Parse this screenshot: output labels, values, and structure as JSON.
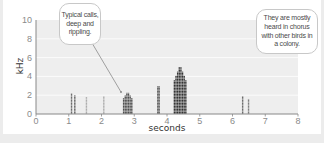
{
  "chart_data": {
    "type": "heatmap",
    "subtype": "spectrogram",
    "title": "",
    "xlabel": "seconds",
    "ylabel": "kHz",
    "xlim": [
      0,
      8
    ],
    "ylim": [
      0,
      10
    ],
    "x_ticks": [
      "0",
      "1",
      "2",
      "3",
      "4",
      "5",
      "6",
      "7",
      "8"
    ],
    "y_ticks": [
      "0",
      "2",
      "4",
      "6",
      "8",
      "10"
    ],
    "grid": "horizontal",
    "syllables": [
      {
        "t_start": 1.05,
        "t_end": 1.12,
        "f_max": 2.2,
        "intensity": 0.7
      },
      {
        "t_start": 1.15,
        "t_end": 1.22,
        "f_max": 2.0,
        "intensity": 0.75
      },
      {
        "t_start": 1.52,
        "t_end": 1.56,
        "f_max": 1.8,
        "intensity": 0.35
      },
      {
        "t_start": 2.05,
        "t_end": 2.09,
        "f_max": 1.9,
        "intensity": 0.35
      },
      {
        "t_start": 2.65,
        "t_end": 2.95,
        "f_max": 2.4,
        "intensity": 0.85
      },
      {
        "t_start": 3.7,
        "t_end": 3.78,
        "f_max": 3.6,
        "intensity": 0.8
      },
      {
        "t_start": 4.2,
        "t_end": 4.6,
        "f_max": 5.2,
        "intensity": 1.0
      },
      {
        "t_start": 6.28,
        "t_end": 6.34,
        "f_max": 1.9,
        "intensity": 0.7
      },
      {
        "t_start": 6.46,
        "t_end": 6.52,
        "f_max": 1.6,
        "intensity": 0.6
      }
    ],
    "annotations": [
      {
        "text": "Typical calls, deep and rippling.",
        "points_to": {
          "t": 2.65,
          "f": 2.4
        }
      },
      {
        "text": "They are mostly heard in chorus with other birds in a colony."
      }
    ]
  },
  "axes": {
    "xlabel": "seconds",
    "ylabel": "kHz",
    "x_ticks": [
      "0",
      "1",
      "2",
      "3",
      "4",
      "5",
      "6",
      "7",
      "8"
    ],
    "y_ticks": [
      "0",
      "2",
      "4",
      "6",
      "8",
      "10"
    ]
  },
  "callouts": {
    "left": {
      "lines": [
        "Typical calls,",
        "deep and",
        "rippling."
      ]
    },
    "right": {
      "lines": [
        "They are mostly",
        "heard in chorus",
        "with other birds in",
        "a colony."
      ]
    }
  },
  "colors": {
    "plot_bg": "#eeeeee",
    "gridline": "#ffffff",
    "axis": "#888888",
    "ink": "#1e1e1e"
  }
}
